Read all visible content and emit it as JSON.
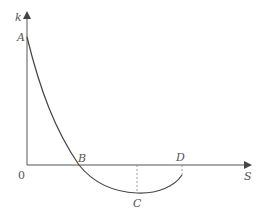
{
  "diagram": {
    "axes": {
      "y_label": "k",
      "x_label": "S",
      "origin_label": "0"
    },
    "points": {
      "A": "A",
      "B": "B",
      "C": "C",
      "D": "D"
    },
    "colors": {
      "line": "#444444",
      "text": "#555555",
      "dashed": "#888888"
    }
  }
}
